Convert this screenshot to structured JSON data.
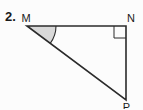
{
  "problem": {
    "number_label": "2."
  },
  "figure": {
    "description": "right triangle MNP with right angle at N and shaded angle at M",
    "vertex_labels": {
      "top_left": "M",
      "top_right": "N",
      "bottom_right": "P"
    },
    "right_angle_marker_at": "N",
    "shaded_angle_at": "M",
    "colors": {
      "line": "#2b2b2b",
      "angle_fill": "#d9d9d9",
      "background": "#fcfcfc"
    }
  }
}
